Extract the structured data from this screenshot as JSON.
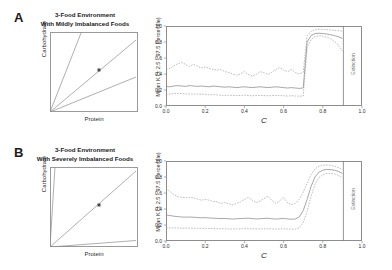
{
  "figure": {
    "panels": [
      {
        "letter": "A",
        "title_line1": "3-Food Environment",
        "title_line2": "With Mildly Imbalanced Foods",
        "nutrient_plot": {
          "xlabel": "Protein",
          "ylabel": "Carbohydrate",
          "rails": [
            {
              "name": "high-carbohydrate-food",
              "slope": 2.55
            },
            {
              "name": "balanced-food",
              "slope": 0.93
            },
            {
              "name": "high-protein-food",
              "slope": 0.4
            }
          ],
          "marker": {
            "name": "intake-target",
            "x": 0.56,
            "y": 0.52
          }
        },
        "line_plot": {
          "xlabel": "C",
          "ylabel": "Mean K (± 2.5 - 97.5 Percentile)",
          "xticks": [
            "0.0",
            "0.2",
            "0.4",
            "0.6",
            "0.8",
            "1.0"
          ],
          "yticks": [
            "0.0",
            "0.2",
            "0.4",
            "0.6",
            "0.8",
            "1.0"
          ],
          "extinction_label": "Extinction",
          "extinction_x": 0.905
        }
      },
      {
        "letter": "B",
        "title_line1": "3-Food Environment",
        "title_line2": "With Severely Imbalanced Foods",
        "nutrient_plot": {
          "xlabel": "Protein",
          "ylabel": "Carbohydrate",
          "rails": [
            {
              "name": "high-carbohydrate-food",
              "slope": 16.0
            },
            {
              "name": "balanced-food",
              "slope": 0.93
            },
            {
              "name": "high-protein-food",
              "slope": 0.075
            }
          ],
          "marker": {
            "name": "intake-target",
            "x": 0.56,
            "y": 0.52
          }
        },
        "line_plot": {
          "xlabel": "C",
          "ylabel": "Mean K (± 2.5 - 97.5 Percentile)",
          "xticks": [
            "0.0",
            "0.2",
            "0.4",
            "0.6",
            "0.8",
            "1.0"
          ],
          "yticks": [
            "0.0",
            "0.2",
            "0.4",
            "0.6",
            "0.8",
            "1.0"
          ],
          "extinction_label": "Extinction",
          "extinction_x": 0.905
        }
      }
    ]
  },
  "chart_data": [
    {
      "type": "line",
      "panel": "A",
      "title": "3-Food Environment With Mildly Imbalanced Foods",
      "xlabel": "C",
      "ylabel": "Mean K (± 2.5 - 97.5 Percentile)",
      "xlim": [
        0.0,
        1.0
      ],
      "ylim": [
        0.0,
        1.0
      ],
      "grid": false,
      "legend": "none",
      "annotations": [
        {
          "text": "Extinction",
          "x": 0.95,
          "y": 0.5,
          "orientation": "vertical"
        },
        {
          "text": "extinction-boundary",
          "x": 0.905,
          "type": "vline"
        }
      ],
      "x": [
        0.0,
        0.02,
        0.04,
        0.06,
        0.08,
        0.1,
        0.12,
        0.14,
        0.16,
        0.18,
        0.2,
        0.22,
        0.24,
        0.26,
        0.28,
        0.3,
        0.32,
        0.34,
        0.36,
        0.38,
        0.4,
        0.42,
        0.44,
        0.46,
        0.48,
        0.5,
        0.52,
        0.54,
        0.56,
        0.58,
        0.6,
        0.62,
        0.64,
        0.66,
        0.68,
        0.7,
        0.72,
        0.74,
        0.76,
        0.78,
        0.8,
        0.82,
        0.84,
        0.86,
        0.88,
        0.9
      ],
      "series": [
        {
          "name": "97.5 percentile",
          "style": "dashed",
          "values": [
            0.455,
            0.47,
            0.5,
            0.53,
            0.545,
            0.52,
            0.495,
            0.52,
            0.5,
            0.475,
            0.49,
            0.47,
            0.455,
            0.45,
            0.455,
            0.43,
            0.42,
            0.4,
            0.385,
            0.4,
            0.43,
            0.395,
            0.375,
            0.395,
            0.43,
            0.415,
            0.395,
            0.42,
            0.455,
            0.48,
            0.45,
            0.43,
            0.455,
            0.42,
            0.4,
            0.42,
            0.88,
            0.93,
            0.955,
            0.96,
            0.958,
            0.955,
            0.95,
            0.945,
            0.94,
            0.935
          ]
        },
        {
          "name": "mean K",
          "style": "solid",
          "values": [
            0.245,
            0.24,
            0.25,
            0.255,
            0.25,
            0.245,
            0.255,
            0.25,
            0.245,
            0.25,
            0.245,
            0.24,
            0.25,
            0.245,
            0.24,
            0.235,
            0.24,
            0.235,
            0.23,
            0.235,
            0.24,
            0.235,
            0.23,
            0.235,
            0.24,
            0.235,
            0.23,
            0.235,
            0.24,
            0.235,
            0.23,
            0.225,
            0.23,
            0.225,
            0.22,
            0.225,
            0.8,
            0.88,
            0.905,
            0.91,
            0.905,
            0.9,
            0.89,
            0.88,
            0.865,
            0.845
          ]
        },
        {
          "name": "2.5 percentile",
          "style": "dashed",
          "values": [
            0.145,
            0.15,
            0.155,
            0.158,
            0.155,
            0.15,
            0.152,
            0.15,
            0.148,
            0.15,
            0.145,
            0.14,
            0.142,
            0.138,
            0.135,
            0.13,
            0.135,
            0.132,
            0.13,
            0.132,
            0.135,
            0.13,
            0.128,
            0.13,
            0.132,
            0.13,
            0.128,
            0.13,
            0.132,
            0.13,
            0.128,
            0.125,
            0.128,
            0.125,
            0.122,
            0.125,
            0.73,
            0.83,
            0.87,
            0.878,
            0.872,
            0.86,
            0.84,
            0.805,
            0.755,
            0.69
          ]
        }
      ]
    },
    {
      "type": "line",
      "panel": "B",
      "title": "3-Food Environment With Severely Imbalanced Foods",
      "xlabel": "C",
      "ylabel": "Mean K (± 2.5 - 97.5 Percentile)",
      "xlim": [
        0.0,
        1.0
      ],
      "ylim": [
        0.0,
        1.0
      ],
      "grid": false,
      "legend": "none",
      "annotations": [
        {
          "text": "Extinction",
          "x": 0.95,
          "y": 0.5,
          "orientation": "vertical"
        },
        {
          "text": "extinction-boundary",
          "x": 0.905,
          "type": "vline"
        }
      ],
      "x": [
        0.0,
        0.02,
        0.04,
        0.06,
        0.08,
        0.1,
        0.12,
        0.14,
        0.16,
        0.18,
        0.2,
        0.22,
        0.24,
        0.26,
        0.28,
        0.3,
        0.32,
        0.34,
        0.36,
        0.38,
        0.4,
        0.42,
        0.44,
        0.46,
        0.48,
        0.5,
        0.52,
        0.54,
        0.56,
        0.58,
        0.6,
        0.62,
        0.64,
        0.66,
        0.68,
        0.7,
        0.72,
        0.74,
        0.76,
        0.78,
        0.8,
        0.82,
        0.84,
        0.86,
        0.88,
        0.9
      ],
      "series": [
        {
          "name": "97.5 percentile",
          "style": "dashed",
          "values": [
            0.655,
            0.62,
            0.58,
            0.555,
            0.545,
            0.54,
            0.545,
            0.54,
            0.525,
            0.51,
            0.52,
            0.51,
            0.495,
            0.49,
            0.47,
            0.48,
            0.465,
            0.45,
            0.47,
            0.49,
            0.52,
            0.545,
            0.51,
            0.48,
            0.5,
            0.53,
            0.56,
            0.505,
            0.47,
            0.5,
            0.545,
            0.48,
            0.455,
            0.47,
            0.52,
            0.61,
            0.72,
            0.83,
            0.9,
            0.935,
            0.948,
            0.95,
            0.945,
            0.935,
            0.92,
            0.895
          ]
        },
        {
          "name": "mean K",
          "style": "solid",
          "values": [
            0.325,
            0.318,
            0.31,
            0.305,
            0.3,
            0.298,
            0.3,
            0.297,
            0.293,
            0.29,
            0.292,
            0.288,
            0.285,
            0.283,
            0.28,
            0.282,
            0.278,
            0.275,
            0.278,
            0.28,
            0.283,
            0.285,
            0.28,
            0.276,
            0.278,
            0.282,
            0.285,
            0.278,
            0.274,
            0.278,
            0.282,
            0.276,
            0.272,
            0.276,
            0.3,
            0.38,
            0.52,
            0.68,
            0.8,
            0.86,
            0.885,
            0.895,
            0.892,
            0.885,
            0.87,
            0.845
          ]
        },
        {
          "name": "2.5 percentile",
          "style": "dashed",
          "values": [
            0.165,
            0.165,
            0.163,
            0.162,
            0.16,
            0.16,
            0.162,
            0.16,
            0.158,
            0.157,
            0.158,
            0.156,
            0.155,
            0.154,
            0.152,
            0.153,
            0.151,
            0.15,
            0.151,
            0.152,
            0.153,
            0.154,
            0.152,
            0.15,
            0.151,
            0.152,
            0.153,
            0.151,
            0.149,
            0.15,
            0.151,
            0.15,
            0.148,
            0.15,
            0.165,
            0.23,
            0.37,
            0.56,
            0.71,
            0.79,
            0.828,
            0.845,
            0.845,
            0.838,
            0.82,
            0.79
          ]
        }
      ]
    }
  ]
}
